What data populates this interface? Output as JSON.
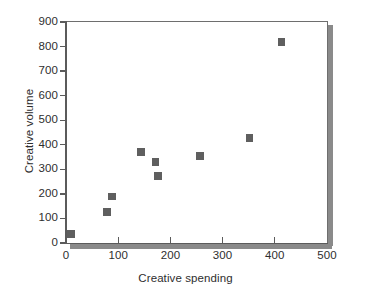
{
  "chart_data": {
    "type": "scatter",
    "title": "",
    "xlabel": "Creative spending",
    "ylabel": "Creative volume",
    "xlim": [
      0,
      500
    ],
    "ylim": [
      0,
      900
    ],
    "xticks": [
      0,
      100,
      200,
      300,
      400,
      500
    ],
    "yticks": [
      0,
      100,
      200,
      300,
      400,
      500,
      600,
      700,
      800,
      900
    ],
    "xtick_labels": [
      "0",
      "100",
      "200",
      "300",
      "400",
      "500"
    ],
    "ytick_labels": [
      "0",
      "100",
      "200",
      "300",
      "400",
      "500",
      "600",
      "700",
      "800",
      "900"
    ],
    "grid": false,
    "legend": false,
    "marker_color": "#5f5f5f",
    "marker_shape": "square",
    "series": [
      {
        "name": "Creative volume vs spending",
        "points": [
          {
            "x": 10,
            "y": 37
          },
          {
            "x": 79,
            "y": 127
          },
          {
            "x": 88,
            "y": 190
          },
          {
            "x": 144,
            "y": 370
          },
          {
            "x": 171,
            "y": 330
          },
          {
            "x": 176,
            "y": 273
          },
          {
            "x": 257,
            "y": 354
          },
          {
            "x": 352,
            "y": 428
          },
          {
            "x": 413,
            "y": 818
          }
        ]
      }
    ]
  }
}
